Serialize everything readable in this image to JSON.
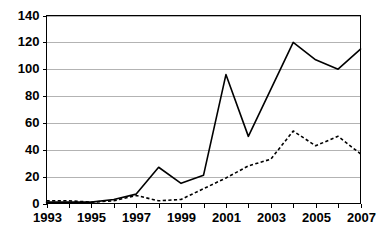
{
  "chart_data": {
    "type": "line",
    "title": "",
    "subtitle": "",
    "xlabel": "",
    "ylabel": "",
    "x": [
      1993,
      1994,
      1995,
      1996,
      1997,
      1998,
      1999,
      2000,
      2001,
      2002,
      2003,
      2004,
      2005,
      2006,
      2007
    ],
    "categories": [
      "1993",
      "1994",
      "1995",
      "1996",
      "1997",
      "1998",
      "1999",
      "2000",
      "2001",
      "2002",
      "2003",
      "2004",
      "2005",
      "2006",
      "2007"
    ],
    "xtick_labels": [
      "1993",
      "",
      "1995",
      "",
      "1997",
      "",
      "1999",
      "",
      "2001",
      "",
      "2003",
      "",
      "2005",
      "",
      "2007"
    ],
    "ytick_labels": [
      "0",
      "20",
      "40",
      "60",
      "80",
      "100",
      "120",
      "140"
    ],
    "ytick_values": [
      0,
      20,
      40,
      60,
      80,
      100,
      120,
      140
    ],
    "xlim": [
      1993,
      2007
    ],
    "ylim": [
      0,
      140
    ],
    "grid": "horizontal",
    "legend": "none",
    "series": [
      {
        "name": "solid-series",
        "style": "solid",
        "color": "#000000",
        "values": [
          1,
          1,
          1,
          3,
          7,
          27,
          15,
          21,
          96,
          50,
          85,
          120,
          107,
          100,
          115
        ]
      },
      {
        "name": "dashed-series",
        "style": "dashed",
        "color": "#000000",
        "values": [
          2,
          2,
          1,
          2,
          6,
          2,
          3,
          11,
          19,
          28,
          33,
          54,
          43,
          50,
          37
        ]
      }
    ]
  }
}
